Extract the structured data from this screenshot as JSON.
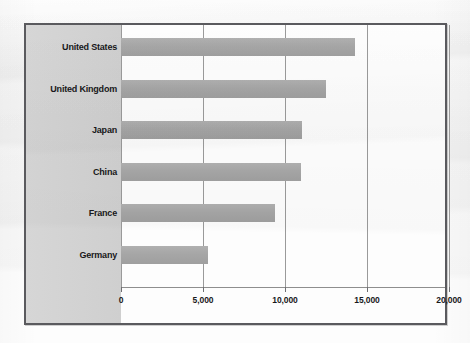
{
  "chart_data": {
    "type": "bar",
    "orientation": "horizontal",
    "title": "",
    "subtitle": "",
    "xlabel": "",
    "ylabel": "",
    "categories": [
      "United States",
      "United Kingdom",
      "Japan",
      "China",
      "France",
      "Germany"
    ],
    "values": [
      14250,
      12480,
      11050,
      11000,
      9400,
      5300
    ],
    "series": [
      {
        "name": "Value",
        "values": [
          14250,
          12480,
          11050,
          11000,
          9400,
          5300
        ],
        "color": "#a6a6a6"
      }
    ],
    "xlim": [
      0,
      20000
    ],
    "ylim": null,
    "xticks": [
      0,
      5000,
      10000,
      15000,
      20000
    ],
    "xtick_labels": [
      "0",
      "5,000",
      "10,000",
      "15,000",
      "20,000"
    ],
    "grid": true,
    "grid_axis": "x",
    "legend": false,
    "legend_position": "none"
  },
  "style": {
    "bar_color": "#a6a6a6",
    "label_band_color": "#d2d2d2",
    "frame_color": "#5a5a5e",
    "grid_color": "#9a9a9a",
    "plot_background": "#fdfdfd",
    "text_color": "#18181a"
  }
}
